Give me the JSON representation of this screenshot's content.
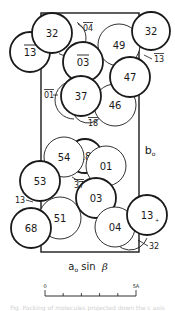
{
  "figure": {
    "type": "crystal-packing-projection",
    "cell_box": {
      "x": 41,
      "y": 13,
      "width": 98,
      "height": 239,
      "color": "#1a1a1a"
    },
    "axis_labels": {
      "vertical": {
        "text": "b",
        "subscript": "o",
        "x": 150,
        "y": 150
      },
      "horizontal": {
        "text": "a",
        "subscript": "o",
        "suffix": " sin ",
        "greek": "β",
        "x": 88,
        "y": 266
      }
    },
    "scale_bar": {
      "start_label": "0",
      "end_label": "5A",
      "x0": 45,
      "x1": 136,
      "y": 296,
      "ticks": 6
    },
    "molecules": [
      {
        "label": "32",
        "cx": 52,
        "cy": 33,
        "r": 20,
        "weight": "heavy",
        "order": 2
      },
      {
        "label": "13",
        "overbar": true,
        "cx": 30,
        "cy": 52,
        "r": 20,
        "weight": "heavy",
        "order": 1
      },
      {
        "label": "32",
        "cx": 151,
        "cy": 31,
        "r": 19,
        "weight": "heavy",
        "order": 2
      },
      {
        "label": "49",
        "cx": 119,
        "cy": 45,
        "r": 21,
        "weight": "light",
        "order": 1
      },
      {
        "label": "03",
        "overbar": true,
        "cx": 83,
        "cy": 62,
        "r": 20,
        "weight": "heavy",
        "order": 1
      },
      {
        "label": "47",
        "cx": 130,
        "cy": 77,
        "r": 20,
        "weight": "heavy",
        "order": 2
      },
      {
        "label": "37",
        "cx": 81,
        "cy": 96,
        "r": 20,
        "weight": "heavy",
        "order": 2
      },
      {
        "label": "46",
        "cx": 115,
        "cy": 105,
        "r": 21,
        "weight": "light",
        "order": 1
      },
      {
        "label": "54",
        "cx": 64,
        "cy": 157,
        "r": 20,
        "weight": "light",
        "order": 2
      },
      {
        "label": "18",
        "cx": 85,
        "cy": 156,
        "r": 17,
        "weight": "heavy",
        "order": 1
      },
      {
        "label": "01",
        "cx": 106,
        "cy": 166,
        "r": 20,
        "weight": "light",
        "order": 1
      },
      {
        "label": "53",
        "cx": 40,
        "cy": 181,
        "r": 20,
        "weight": "heavy",
        "order": 2
      },
      {
        "label": "03",
        "cx": 96,
        "cy": 198,
        "r": 20,
        "weight": "heavy",
        "order": 2
      },
      {
        "label": "51",
        "cx": 60,
        "cy": 218,
        "r": 21,
        "weight": "light",
        "order": 1
      },
      {
        "label": "68",
        "cx": 31,
        "cy": 228,
        "r": 20,
        "weight": "heavy",
        "order": 2
      },
      {
        "label": "04",
        "cx": 115,
        "cy": 227,
        "r": 20,
        "weight": "light",
        "order": 2
      },
      {
        "label": "13",
        "cx": 147,
        "cy": 215,
        "r": 20,
        "weight": "heavy",
        "order": 3,
        "subscript_mark": "+"
      }
    ],
    "partial_arcs": [
      {
        "cx": 68,
        "cy": 38,
        "r": 18,
        "start": -60,
        "end": 120,
        "note": "background molecule behind 32"
      },
      {
        "cx": 74,
        "cy": 100,
        "r": 19,
        "start": 90,
        "end": 270,
        "note": "crescent behind 37"
      },
      {
        "cx": 88,
        "cy": 107,
        "r": 16,
        "start": 30,
        "end": 170,
        "note": "crescent 18 under 37"
      },
      {
        "cx": 130,
        "cy": 232,
        "r": 18,
        "start": 20,
        "end": 170,
        "note": "crescent 32 under 04"
      }
    ],
    "small_labels": [
      {
        "text": "04",
        "overbar": true,
        "x": 88,
        "y": 28,
        "leader": [
          [
            78,
            24
          ],
          [
            83,
            28
          ]
        ]
      },
      {
        "text": "13",
        "overbar": true,
        "x": 159,
        "y": 59,
        "leader": [
          [
            144,
            55
          ],
          [
            152,
            59
          ]
        ]
      },
      {
        "text": "01",
        "overbar": true,
        "x": 49,
        "y": 95,
        "leader": [
          [
            53,
            95
          ],
          [
            58,
            95
          ]
        ]
      },
      {
        "text": "18",
        "overbar": true,
        "x": 93,
        "y": 123,
        "leader": []
      },
      {
        "text": "37",
        "overbar": true,
        "x": 79,
        "y": 185,
        "leader": [
          [
            72,
            177
          ],
          [
            80,
            182
          ]
        ]
      },
      {
        "text": "13",
        "overbar": false,
        "x": 20,
        "y": 200,
        "leader": [
          [
            26,
            200
          ],
          [
            33,
            202
          ]
        ]
      },
      {
        "text": "32",
        "overbar": false,
        "x": 154,
        "y": 246,
        "leader": [
          [
            138,
            240
          ],
          [
            148,
            246
          ]
        ]
      }
    ],
    "footer_text": "Fig. Packing of molecules projected down the c axis"
  }
}
